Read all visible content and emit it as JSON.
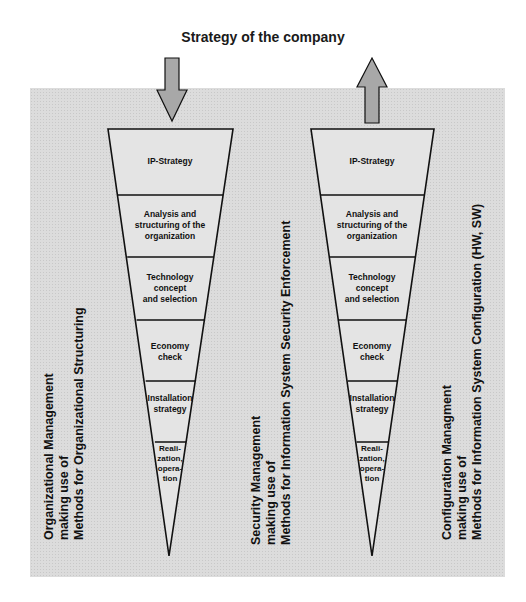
{
  "title": "Strategy of the company",
  "colors": {
    "panel": "#dcdcdc",
    "arrow": "#a8a8a8",
    "line": "#111111"
  },
  "left_funnel": {
    "arrow": "arrow-down",
    "stages": [
      "IP-Strategy",
      "Analysis and structuring of the organization",
      "Technology concept and selection",
      "Economy check",
      "Installation strategy",
      "Reali-zation, opera-tion"
    ]
  },
  "right_funnel": {
    "arrow": "arrow-up",
    "stages": [
      "IP-Strategy",
      "Analysis and structuring of the organization",
      "Technology concept and selection",
      "Economy check",
      "Installation strategy",
      "Reali-zation, opera-tion"
    ]
  },
  "side_labels": {
    "organizational": {
      "line1": "Organizational Management",
      "line2": "making use of",
      "line3": "Methods for Organizational Structuring"
    },
    "security": {
      "line1": "Security Management",
      "line2": "making use of",
      "line3": "Methods for Information System Security Enforcement"
    },
    "configuration": {
      "line1": "Configuration Managment",
      "line2": "making use of",
      "line3": "Methods for Information System Configuration (HW, SW)"
    }
  },
  "stage_text": {
    "left": [
      [
        "IP-Strategy"
      ],
      [
        "Analysis and",
        "structuring of the",
        "organization"
      ],
      [
        "Technology",
        "concept",
        "and selection"
      ],
      [
        "Economy",
        "check"
      ],
      [
        "Installation",
        "strategy"
      ],
      [
        "Reali-",
        "zation,",
        "opera-",
        "tion"
      ]
    ]
  }
}
